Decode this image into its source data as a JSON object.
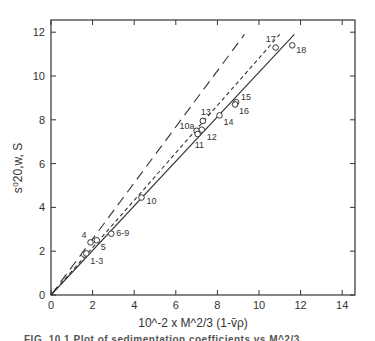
{
  "chart_data": {
    "type": "scatter",
    "title": "",
    "xlabel": "10^-2 x M^2/3 (1-v̄ρ)",
    "ylabel": "s⁰20,w, S",
    "xlim": [
      0,
      14.4
    ],
    "ylim": [
      0,
      12.6
    ],
    "xticks": [
      0,
      2,
      4,
      6,
      8,
      10,
      12,
      14
    ],
    "yticks": [
      0,
      2,
      4,
      6,
      8,
      10,
      12
    ],
    "grid": false,
    "points": [
      {
        "label": "1-3",
        "x": 1.6,
        "y": 1.85
      },
      {
        "label": "",
        "x": 1.7,
        "y": 1.9
      },
      {
        "label": "4",
        "x": 1.9,
        "y": 2.4
      },
      {
        "label": "5",
        "x": 2.2,
        "y": 2.5
      },
      {
        "label": "6-9",
        "x": 2.9,
        "y": 2.8
      },
      {
        "label": "10",
        "x": 4.35,
        "y": 4.45
      },
      {
        "label": "10a",
        "x": 7.0,
        "y": 7.5
      },
      {
        "label": "11",
        "x": 7.05,
        "y": 7.35
      },
      {
        "label": "12",
        "x": 7.25,
        "y": 7.55
      },
      {
        "label": "13",
        "x": 7.3,
        "y": 7.95
      },
      {
        "label": "14",
        "x": 8.1,
        "y": 8.2
      },
      {
        "label": "15",
        "x": 8.9,
        "y": 8.8
      },
      {
        "label": "16",
        "x": 8.85,
        "y": 8.7
      },
      {
        "label": "17",
        "x": 10.8,
        "y": 11.3
      },
      {
        "label": "18",
        "x": 11.6,
        "y": 11.4
      }
    ],
    "lines": [
      {
        "name": "solid",
        "style": "solid",
        "x": [
          0,
          11.7
        ],
        "y": [
          0,
          11.9
        ]
      },
      {
        "name": "short-dash",
        "style": "short-dash",
        "x": [
          0,
          11.0
        ],
        "y": [
          0,
          11.9
        ]
      },
      {
        "name": "long-dash",
        "style": "long-dash",
        "x": [
          0,
          9.3
        ],
        "y": [
          0,
          11.9
        ]
      }
    ]
  },
  "caption": "FIG. 10.1  Plot of sedimentation coefficients vs M^2/3 ..."
}
